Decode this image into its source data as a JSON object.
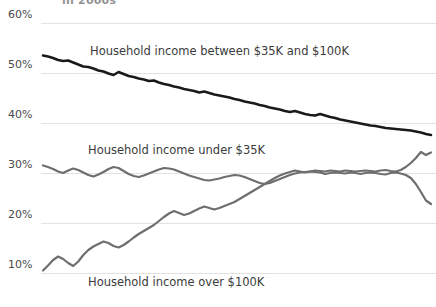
{
  "clipped_title": "in 2000s",
  "axis": {
    "y_ticks": [
      "60%",
      "50%",
      "40%",
      "30%",
      "20%",
      "10%"
    ],
    "y_tick_values": [
      60,
      50,
      40,
      30,
      20,
      10
    ]
  },
  "labels": {
    "middle": "Household income between $35K and $100K",
    "low": "Household income under $35K",
    "high": "Household income over $100K"
  },
  "colors": {
    "middle_line": "#1a1a1a",
    "low_line": "#6e6e6e",
    "high_line": "#6e6e6e",
    "gridline": "#e2e2e2",
    "tick_text": "#4a4a4a",
    "label_text": "#3b3b3b",
    "background": "#ffffff"
  },
  "chart_data": {
    "type": "line",
    "title": "in 2000s",
    "xlabel": "",
    "ylabel": "",
    "ylim": [
      5,
      62
    ],
    "grid": true,
    "legend_position": "inline-annotations",
    "yticks": [
      10,
      20,
      30,
      40,
      50,
      60
    ],
    "ytick_labels": [
      "10%",
      "20%",
      "30%",
      "40%",
      "50%",
      "60%"
    ],
    "x": [
      0,
      1,
      2,
      3,
      4,
      5,
      6,
      7,
      8,
      9,
      10,
      11,
      12,
      13,
      14,
      15,
      16,
      17,
      18,
      19,
      20,
      21,
      22,
      23,
      24,
      25,
      26,
      27,
      28,
      29,
      30,
      31,
      32,
      33,
      34,
      35,
      36,
      37,
      38,
      39,
      40,
      41,
      42,
      43,
      44,
      45,
      46,
      47,
      48,
      49,
      50,
      51,
      52,
      53,
      54,
      55,
      56,
      57,
      58,
      59,
      60,
      61,
      62,
      63,
      64,
      65,
      66,
      67,
      68,
      69,
      70,
      71,
      72,
      73,
      74,
      75,
      76,
      77
    ],
    "series": [
      {
        "name": "Household income between $35K and $100K",
        "color": "#1a1a1a",
        "values": [
          53.5,
          53.3,
          53.0,
          52.6,
          52.4,
          52.5,
          52.1,
          51.7,
          51.3,
          51.2,
          50.9,
          50.5,
          50.3,
          49.9,
          49.6,
          50.2,
          49.8,
          49.4,
          49.2,
          48.9,
          48.7,
          48.4,
          48.5,
          48.1,
          47.8,
          47.6,
          47.3,
          47.1,
          46.8,
          46.6,
          46.4,
          46.1,
          46.3,
          46.0,
          45.7,
          45.5,
          45.3,
          45.1,
          44.8,
          44.6,
          44.3,
          44.1,
          43.9,
          43.6,
          43.4,
          43.1,
          42.9,
          42.7,
          42.4,
          42.2,
          42.4,
          42.1,
          41.8,
          41.6,
          41.5,
          41.8,
          41.5,
          41.2,
          41.0,
          40.7,
          40.5,
          40.3,
          40.1,
          39.9,
          39.7,
          39.5,
          39.4,
          39.2,
          39.0,
          38.9,
          38.8,
          38.7,
          38.6,
          38.5,
          38.3,
          38.1,
          37.8,
          37.6
        ]
      },
      {
        "name": "Household income under $35K",
        "color": "#6e6e6e",
        "values": [
          31.5,
          31.2,
          30.8,
          30.3,
          30.0,
          30.5,
          30.9,
          30.6,
          30.1,
          29.6,
          29.3,
          29.7,
          30.2,
          30.8,
          31.2,
          31.0,
          30.4,
          29.8,
          29.4,
          29.2,
          29.5,
          29.9,
          30.3,
          30.7,
          31.0,
          30.9,
          30.7,
          30.3,
          29.9,
          29.5,
          29.2,
          28.9,
          28.6,
          28.5,
          28.7,
          28.9,
          29.2,
          29.4,
          29.6,
          29.5,
          29.2,
          28.8,
          28.4,
          28.0,
          27.8,
          28.0,
          28.4,
          28.8,
          29.2,
          29.6,
          29.9,
          30.1,
          30.2,
          30.3,
          30.2,
          30.1,
          29.8,
          30.0,
          30.1,
          30.0,
          29.9,
          30.1,
          30.0,
          29.8,
          30.0,
          30.1,
          30.0,
          29.8,
          29.7,
          30.0,
          30.1,
          29.9,
          29.6,
          29.0,
          27.8,
          26.2,
          24.5,
          23.8
        ]
      },
      {
        "name": "Household income over $100K",
        "color": "#6e6e6e",
        "values": [
          10.5,
          11.5,
          12.6,
          13.3,
          12.8,
          12.0,
          11.4,
          12.3,
          13.6,
          14.6,
          15.3,
          15.8,
          16.3,
          16.0,
          15.4,
          15.1,
          15.6,
          16.3,
          17.1,
          17.8,
          18.4,
          19.0,
          19.6,
          20.4,
          21.2,
          21.9,
          22.4,
          22.0,
          21.6,
          21.9,
          22.4,
          22.9,
          23.3,
          23.0,
          22.7,
          23.0,
          23.4,
          23.8,
          24.2,
          24.8,
          25.4,
          26.0,
          26.6,
          27.2,
          27.8,
          28.4,
          29.0,
          29.5,
          29.9,
          30.2,
          30.5,
          30.3,
          30.1,
          30.3,
          30.5,
          30.4,
          30.3,
          30.5,
          30.4,
          30.3,
          30.5,
          30.4,
          30.3,
          30.4,
          30.5,
          30.4,
          30.3,
          30.5,
          30.6,
          30.4,
          30.3,
          30.6,
          31.2,
          32.0,
          33.0,
          34.2,
          33.6,
          34.1
        ]
      }
    ]
  }
}
